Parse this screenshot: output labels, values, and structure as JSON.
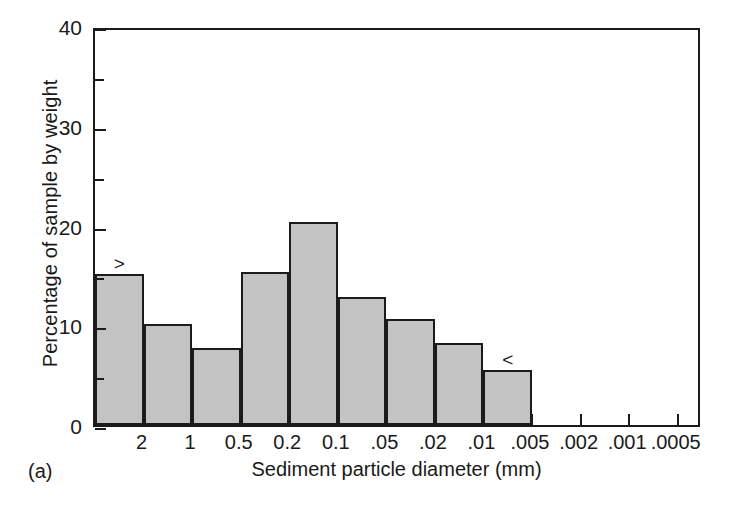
{
  "panel": {
    "letter": "(a)"
  },
  "chart_data": {
    "type": "bar",
    "title": "",
    "xlabel": "Sediment particle diameter (mm)",
    "ylabel": "Percentage of sample by weight",
    "ylim": [
      0,
      40
    ],
    "ytick_labels": [
      "0",
      "10",
      "20",
      "30",
      "40"
    ],
    "ytick_values": [
      0,
      10,
      20,
      30,
      40
    ],
    "yminor_values": [
      5,
      15,
      25,
      35
    ],
    "grid": false,
    "legend": null,
    "xtick_labels": [
      "2",
      "1",
      "0.5",
      "0.2",
      "0.1",
      ".05",
      ".02",
      ".01",
      ".005",
      ".002",
      ".001",
      ".0005"
    ],
    "x_axis_note": "logarithmic, decreasing particle diameter left to right",
    "categories": [
      "> 2",
      "2 - 1",
      "1 - 0.5",
      "0.5 - 0.2",
      "0.2 - 0.1",
      "0.1 - .05",
      ".05 - .02",
      ".02 - .01",
      "< .01"
    ],
    "values": [
      15.1,
      10.1,
      7.7,
      15.3,
      20.4,
      12.8,
      10.6,
      8.2,
      5.5
    ],
    "bar_color": "#c3c3c3",
    "bar_edge_color": "#1b1b1b",
    "annotations": [
      {
        "text": ">",
        "bar_index": 0
      },
      {
        "text": "<",
        "bar_index": 8
      }
    ]
  }
}
